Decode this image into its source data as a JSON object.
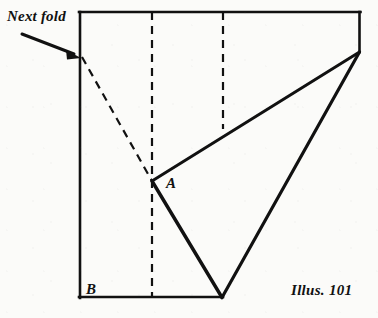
{
  "figure": {
    "caption": "Illus. 101",
    "annotation": "Next fold",
    "point_labels": {
      "a": "A",
      "b": "B"
    },
    "colors": {
      "ink": "#111111",
      "paper": "#fbfbf9",
      "fold_line": "#111111"
    },
    "geometry": {
      "sheet_outline": {
        "name": "paper-sheet-outline",
        "points": "79,12 360,12 360,52 222,298 79,298"
      },
      "solid_lines": [
        {
          "name": "sheet-edge-top",
          "x1": 79,
          "y1": 12,
          "x2": 360,
          "y2": 12
        },
        {
          "name": "sheet-edge-right",
          "x1": 360,
          "y1": 12,
          "x2": 360,
          "y2": 52
        },
        {
          "name": "sheet-edge-left",
          "x1": 79,
          "y1": 12,
          "x2": 79,
          "y2": 298
        },
        {
          "name": "sheet-edge-bottom",
          "x1": 79,
          "y1": 298,
          "x2": 222,
          "y2": 298
        },
        {
          "name": "fold-edge-right-diagonal",
          "x1": 360,
          "y1": 52,
          "x2": 222,
          "y2": 298
        },
        {
          "name": "fold-edge-a-to-corner",
          "x1": 152,
          "y1": 181,
          "x2": 360,
          "y2": 52
        },
        {
          "name": "fold-edge-a-to-bottom",
          "x1": 152,
          "y1": 181,
          "x2": 222,
          "y2": 298
        }
      ],
      "dashed_lines": [
        {
          "name": "fold-line-vertical-left",
          "x1": 152,
          "y1": 12,
          "x2": 152,
          "y2": 298
        },
        {
          "name": "fold-line-vertical-right",
          "x1": 223,
          "y1": 12,
          "x2": 223,
          "y2": 129
        },
        {
          "name": "fold-line-next-diagonal",
          "x1": 82,
          "y1": 57,
          "x2": 152,
          "y2": 181
        }
      ],
      "arrow": {
        "name": "next-fold-arrow",
        "x1": 22,
        "y1": 34,
        "x2": 80,
        "y2": 57
      },
      "points": {
        "a": {
          "x": 152,
          "y": 181
        },
        "b": {
          "x": 79,
          "y": 298
        }
      }
    }
  }
}
